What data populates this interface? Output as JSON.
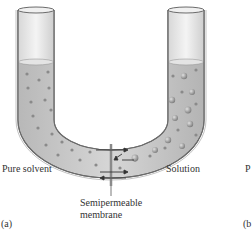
{
  "diagram": {
    "labels": {
      "left": "Pure solvent",
      "right": "Solution",
      "membrane_line1": "Semipermeable",
      "membrane_line2": "membrane",
      "panel_a": "(a)",
      "panel_b_partial": "(b",
      "right_cut_label": "P"
    },
    "colors": {
      "tube_outline": "#6b6b6b",
      "liquid": "#c8c8c8",
      "particle": "#8a8a8a",
      "membrane": "#9a9a9a"
    }
  }
}
